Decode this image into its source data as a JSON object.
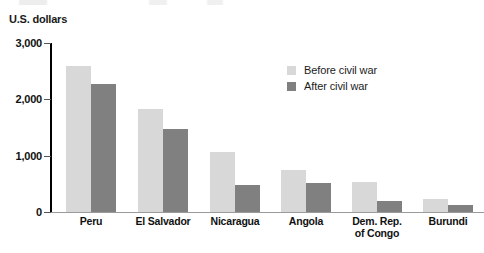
{
  "chart_data": {
    "type": "bar",
    "title": "",
    "subtitle": "",
    "xlabel": "",
    "ylabel": "U.S. dollars",
    "ylim": [
      0,
      3000
    ],
    "yticks": [
      0,
      1000,
      2000,
      3000
    ],
    "ytick_labels": [
      "0",
      "1,000",
      "2,000",
      "3,000"
    ],
    "grid": false,
    "legend_position": "upper right",
    "categories": [
      "Peru",
      "El Salvador",
      "Nicaragua",
      "Angola",
      "Dem. Rep.\nof Congo",
      "Burundi"
    ],
    "category_labels": [
      "Peru",
      "El Salvador",
      "Nicaragua",
      "Angola",
      [
        "Dem. Rep.",
        "of Congo"
      ],
      "Burundi"
    ],
    "series": [
      {
        "name": "Before civil war",
        "color": "#d8d8d8",
        "values": [
          2600,
          1830,
          1070,
          740,
          530,
          230
        ]
      },
      {
        "name": "After civil war",
        "color": "#808080",
        "values": [
          2270,
          1470,
          480,
          520,
          200,
          120
        ]
      }
    ]
  },
  "legend": {
    "items": [
      {
        "label": "Before civil war",
        "color": "#d8d8d8"
      },
      {
        "label": "After civil war",
        "color": "#808080"
      }
    ]
  },
  "axis": {
    "y_title": "U.S. dollars",
    "tick_labels": [
      "3,000",
      "2,000",
      "1,000",
      "0"
    ]
  }
}
